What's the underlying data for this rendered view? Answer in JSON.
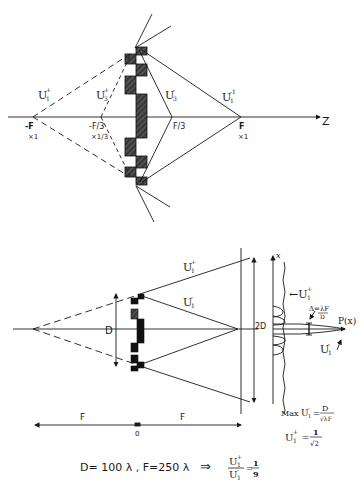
{
  "top_diagram": {
    "axis_label": "Z",
    "points": [
      {
        "label": "-F",
        "sub": "×1",
        "x": 33,
        "y": 117
      },
      {
        "label": "-F/3",
        "sub": "×1/3",
        "x": 101,
        "y": 117
      },
      {
        "label": "F/3",
        "sub": "",
        "x": 172,
        "y": 117
      },
      {
        "label": "F",
        "sub": "×1",
        "x": 241,
        "y": 117
      }
    ],
    "beam_labels": [
      {
        "text": "U",
        "sup": "+",
        "sub": "1",
        "x": 42,
        "y": 95
      },
      {
        "text": "U",
        "sup": "+",
        "sub": "3",
        "x": 97,
        "y": 96
      },
      {
        "text": "U",
        "sup": "-",
        "sub": "3",
        "x": 166,
        "y": 96
      },
      {
        "text": "U",
        "sup": "-1",
        "sub": "1",
        "x": 222,
        "y": 97
      }
    ]
  },
  "bottom_diagram": {
    "aperture_label": "D",
    "screen_label": "2D",
    "x_axis_label": "x",
    "beam_labels": [
      {
        "text": "U",
        "sup": "+",
        "sub": "1",
        "x": 185,
        "y": 267
      },
      {
        "text": "U",
        "sup": "-",
        "sub": "1",
        "x": 185,
        "y": 303
      }
    ],
    "profile_labels": {
      "upper": "←U",
      "upper_sup": "+",
      "upper_sub": "1",
      "width": "Δ=λF/D",
      "width_num": "Δ=λF",
      "width_den": "D",
      "intensity": "P(x)",
      "lower": "U",
      "lower_sup": "-",
      "lower_sub": "1"
    },
    "distances": [
      {
        "label": "F",
        "x": 83
      },
      {
        "label": "F",
        "x": 183
      }
    ],
    "origin_label": "0"
  },
  "formulas": {
    "max_prefix": "Max",
    "max_u": "U",
    "max_u_sup": "-",
    "max_u_sub": "1",
    "max_eq": "=",
    "max_num": "D",
    "max_den": "√λF",
    "u1_plus": "U",
    "u1_plus_sup": "+",
    "u1_plus_sub": "1",
    "u1_plus_eq": "=",
    "u1_plus_num": "1",
    "u1_plus_den": "√2",
    "params": "D= 100 λ  , F=250 λ",
    "implies": "⇒",
    "ratio_num": "U",
    "ratio_num_sup": "+",
    "ratio_num_sub": "1",
    "ratio_den": "U",
    "ratio_den_sup": "-",
    "ratio_den_sub": "1",
    "ratio_eq": "=",
    "ratio_val_num": "1",
    "ratio_val_den": "9"
  }
}
